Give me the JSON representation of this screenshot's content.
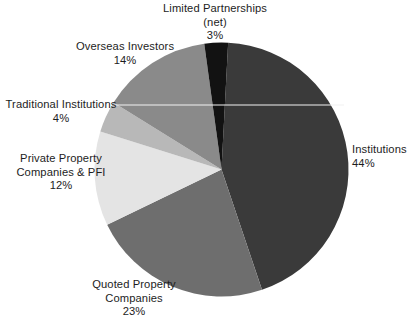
{
  "chart_data": {
    "type": "pie",
    "title": "",
    "subtitle": "",
    "xlabel": "",
    "ylabel": "",
    "legend_position": "none",
    "grid": false,
    "value_unit": "%",
    "total": 100,
    "start_angle_deg": 3,
    "direction": "clockwise",
    "categories": [
      "Institutions",
      "Quoted Property Companies",
      "Private Property Companies & PFI",
      "Traditional Institutions",
      "Overseas Investors",
      "Limited Partnerships (net)"
    ],
    "values": [
      44,
      23,
      12,
      4,
      14,
      3
    ],
    "colors": [
      "#3a3a3a",
      "#6e6e6e",
      "#e4e4e4",
      "#b8b8b8",
      "#8a8a8a",
      "#121212"
    ],
    "slices": [
      {
        "name": "Institutions",
        "label_line1": "Institutions",
        "label_line2": "",
        "percent_text": "44%",
        "value": 44,
        "color": "#3a3a3a"
      },
      {
        "name": "Quoted Property Companies",
        "label_line1": "Quoted Property",
        "label_line2": "Companies",
        "percent_text": "23%",
        "value": 23,
        "color": "#6e6e6e"
      },
      {
        "name": "Private Property Companies & PFI",
        "label_line1": "Private Property",
        "label_line2": "Companies & PFI",
        "percent_text": "12%",
        "value": 12,
        "color": "#e4e4e4"
      },
      {
        "name": "Traditional Institutions",
        "label_line1": "Traditional Institutions",
        "label_line2": "",
        "percent_text": "4%",
        "value": 4,
        "color": "#b8b8b8"
      },
      {
        "name": "Overseas Investors",
        "label_line1": "Overseas Investors",
        "label_line2": "",
        "percent_text": "14%",
        "value": 14,
        "color": "#8a8a8a"
      },
      {
        "name": "Limited Partnerships (net)",
        "label_line1": "Limited Partnerships",
        "label_line2": "(net)",
        "percent_text": "3%",
        "value": 3,
        "color": "#121212"
      }
    ]
  },
  "style": {
    "background": "#ffffff",
    "text_color": "#1d1d1d",
    "leader_line_color": "#f2f2f2"
  }
}
